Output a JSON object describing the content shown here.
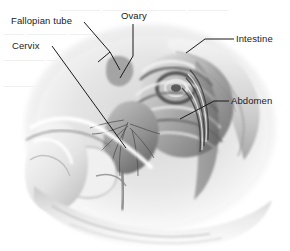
{
  "figure": {
    "width": 290,
    "height": 251,
    "background_color": "#ffffff",
    "style": "grayscale medical line-and-tone illustration",
    "view": "mid-sagittal section, facing left"
  },
  "labels": [
    {
      "id": "fallopian-tube",
      "text": "Fallopian tube",
      "x": 11,
      "y": 15,
      "leader": "forked line from label to two arrowheads at the adnexa",
      "color": "#1b1b1b"
    },
    {
      "id": "cervix",
      "text": "Cervix",
      "x": 12,
      "y": 40,
      "leader": "long diagonal line descending to the right toward the cervix",
      "color": "#1b1b1b"
    },
    {
      "id": "ovary",
      "text": "Ovary",
      "x": 121,
      "y": 10,
      "leader": "vertical line descending then angling left to the ovary",
      "color": "#1b1b1b"
    },
    {
      "id": "intestine",
      "text": "Intestine",
      "x": 236,
      "y": 33,
      "leader": "horizontal line running left then angling down to the bowel coils",
      "color": "#1b1b1b"
    },
    {
      "id": "abdomen",
      "text": "Abdomen",
      "x": 231,
      "y": 95,
      "leader": "horizontal line running left then angling down-left to the abdominal wall",
      "color": "#1b1b1b"
    }
  ],
  "anatomy_regions": [
    {
      "id": "abdominal-wall",
      "description": "anterior abdominal wall, light tone, upper right mass"
    },
    {
      "id": "intestine-coils",
      "description": "concentric bowel loops, mid right"
    },
    {
      "id": "uterus",
      "description": "central pear-shaped organ with branching vessels"
    },
    {
      "id": "bladder",
      "description": "light rounded structure anterior and inferior"
    },
    {
      "id": "rectum-sacrum",
      "description": "banded vertical column at right of midline"
    },
    {
      "id": "thigh",
      "description": "large pale mass at lower left"
    },
    {
      "id": "buttock-contour",
      "description": "broad pale contour sweeping across the bottom"
    }
  ],
  "palette": {
    "ink": "#1b1b1b",
    "background": "#ffffff",
    "tone_light": "#efefef",
    "tone_mid": "#b9b9b9",
    "tone_dark": "#6f6f6f",
    "tone_deep": "#3a3a3a",
    "ghost": "#ededed"
  },
  "background_artifacts": {
    "description": "faint ghosted text bleed-through from the reverse page",
    "color": "#ededed",
    "rows": [
      {
        "x": 60,
        "y": 6,
        "text": "————  ———  —————  ————"
      },
      {
        "x": 4,
        "y": 30,
        "text": "——  ————  ———  —————"
      },
      {
        "x": 4,
        "y": 56,
        "text": "————  ———  ————"
      },
      {
        "x": 4,
        "y": 82,
        "text": "———  —————  ——"
      }
    ]
  }
}
